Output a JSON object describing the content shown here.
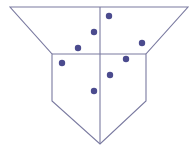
{
  "canvas": {
    "width": 195,
    "height": 154,
    "background": "#ffffff"
  },
  "style": {
    "line_color": "#7a7aa0",
    "line_width": 1.1,
    "dot_color": "#4b4b8e",
    "dot_radius": 3.2
  },
  "shape": {
    "outline": [
      [
        10,
        7
      ],
      [
        188,
        7
      ],
      [
        146,
        54
      ],
      [
        146,
        101
      ],
      [
        100,
        144
      ],
      [
        52,
        101
      ],
      [
        52,
        54
      ]
    ],
    "horizontal_divider": [
      [
        52,
        54
      ],
      [
        146,
        54
      ]
    ],
    "vertical_divider": [
      [
        100,
        7
      ],
      [
        100,
        144
      ]
    ]
  },
  "points": [
    {
      "x": 109,
      "y": 16
    },
    {
      "x": 94,
      "y": 32
    },
    {
      "x": 78,
      "y": 48
    },
    {
      "x": 142,
      "y": 43
    },
    {
      "x": 62,
      "y": 63
    },
    {
      "x": 126,
      "y": 59
    },
    {
      "x": 110,
      "y": 75
    },
    {
      "x": 94,
      "y": 91
    }
  ]
}
